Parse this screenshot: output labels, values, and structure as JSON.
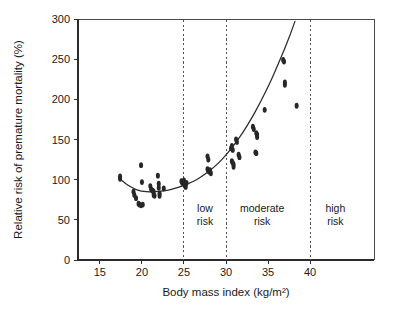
{
  "chart_data": {
    "type": "scatter",
    "title": "",
    "xlabel": "Body mass index (kg/m²)",
    "ylabel": "Relative risk of premature mortality (%)",
    "xlim": [
      12.4,
      47.6
    ],
    "ylim": [
      0,
      300
    ],
    "grid": false,
    "legend": "none",
    "xticks": [
      15,
      20,
      25,
      30,
      35,
      40
    ],
    "xtick_labels": [
      "15",
      "20",
      "25",
      "30",
      "35",
      "40"
    ],
    "yticks": [
      0,
      50,
      100,
      150,
      200,
      250,
      300
    ],
    "ytick_labels": [
      "0",
      "50",
      "100",
      "150",
      "200",
      "250",
      "300"
    ],
    "annotations": [
      {
        "text_line1": "low",
        "text_line2": "risk",
        "x": 27.5,
        "y": 60
      },
      {
        "text_line1": "moderate",
        "text_line2": "risk",
        "x": 34.3,
        "y": 60
      },
      {
        "text_line1": "high",
        "text_line2": "risk",
        "x": 43.0,
        "y": 60
      }
    ],
    "dividers": [
      {
        "x": 25,
        "label": "low-risk-boundary"
      },
      {
        "x": 30,
        "label": "moderate-risk-boundary"
      },
      {
        "x": 40,
        "label": "high-risk-boundary"
      }
    ],
    "series": [
      {
        "name": "Observed relative risk",
        "type": "scatter",
        "marker": "filled-ellipse",
        "points": [
          [
            17.4,
            104
          ],
          [
            17.4,
            101
          ],
          [
            19.0,
            85
          ],
          [
            19.1,
            81
          ],
          [
            19.3,
            77
          ],
          [
            19.6,
            70
          ],
          [
            19.7,
            69
          ],
          [
            19.9,
            68
          ],
          [
            20.1,
            69
          ],
          [
            19.9,
            118
          ],
          [
            20.0,
            97
          ],
          [
            21.0,
            92
          ],
          [
            21.1,
            88
          ],
          [
            21.2,
            87
          ],
          [
            21.3,
            86
          ],
          [
            21.4,
            85
          ],
          [
            21.4,
            81
          ],
          [
            21.5,
            80
          ],
          [
            21.9,
            105
          ],
          [
            22.0,
            95
          ],
          [
            22.0,
            90
          ],
          [
            22.1,
            83
          ],
          [
            22.1,
            80
          ],
          [
            22.6,
            89
          ],
          [
            24.7,
            98
          ],
          [
            24.8,
            96
          ],
          [
            24.9,
            97
          ],
          [
            25.0,
            99
          ],
          [
            25.0,
            95
          ],
          [
            25.1,
            94
          ],
          [
            25.2,
            93
          ],
          [
            25.2,
            91
          ],
          [
            25.3,
            96
          ],
          [
            27.8,
            129
          ],
          [
            27.9,
            125
          ],
          [
            27.8,
            113
          ],
          [
            27.9,
            111
          ],
          [
            28.0,
            110
          ],
          [
            28.1,
            112
          ],
          [
            28.2,
            108
          ],
          [
            30.6,
            139
          ],
          [
            30.7,
            142
          ],
          [
            30.8,
            137
          ],
          [
            30.7,
            123
          ],
          [
            30.8,
            121
          ],
          [
            30.9,
            119
          ],
          [
            30.9,
            116
          ],
          [
            31.2,
            150
          ],
          [
            31.3,
            147
          ],
          [
            31.5,
            131
          ],
          [
            31.6,
            128
          ],
          [
            33.2,
            166
          ],
          [
            33.3,
            163
          ],
          [
            33.6,
            158
          ],
          [
            33.7,
            156
          ],
          [
            33.7,
            153
          ],
          [
            33.5,
            134
          ],
          [
            33.6,
            133
          ],
          [
            34.6,
            187
          ],
          [
            36.8,
            249
          ],
          [
            36.9,
            247
          ],
          [
            37.0,
            221
          ],
          [
            37.0,
            218
          ],
          [
            38.4,
            192
          ]
        ]
      },
      {
        "name": "Fitted J-curve",
        "type": "line",
        "points": [
          [
            17.5,
            100
          ],
          [
            18.5,
            92
          ],
          [
            19.5,
            87
          ],
          [
            20.5,
            85
          ],
          [
            21.5,
            85
          ],
          [
            22.5,
            86
          ],
          [
            23.5,
            88
          ],
          [
            24.5,
            91
          ],
          [
            25.5,
            95
          ],
          [
            26.5,
            100
          ],
          [
            27.5,
            107
          ],
          [
            28.5,
            115
          ],
          [
            29.5,
            125
          ],
          [
            30.5,
            137
          ],
          [
            31.5,
            151
          ],
          [
            32.5,
            167
          ],
          [
            33.5,
            185
          ],
          [
            34.5,
            205
          ],
          [
            35.5,
            227
          ],
          [
            36.5,
            251
          ],
          [
            37.5,
            277
          ],
          [
            38.2,
            297
          ]
        ]
      }
    ]
  },
  "figure": {
    "background": "#ffffff",
    "axis_color": "#2b2b2b",
    "point_color": "#272727",
    "curve_color": "#2b2b2b",
    "divider_color": "#555555"
  }
}
